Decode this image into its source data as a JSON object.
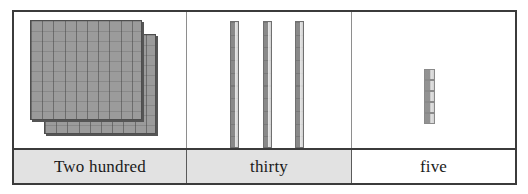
{
  "figure": {
    "kind": "place-value-blocks-table"
  },
  "colors": {
    "block_fill": "#9b9b9b",
    "block_line": "#4e4e4e",
    "table_border": "#3b3b3b",
    "label_shaded_bg": "#e2e2e2",
    "label_plain_bg": "#ffffff",
    "text": "#1a1a1a"
  },
  "columns": [
    {
      "place": "hundreds",
      "label": "Two hundred",
      "label_shaded": true,
      "block_type": "flat",
      "block_count": 2,
      "value": 200
    },
    {
      "place": "tens",
      "label": "thirty",
      "label_shaded": true,
      "block_type": "rod",
      "block_count": 3,
      "value": 30
    },
    {
      "place": "ones",
      "label": "five",
      "label_shaded": false,
      "block_type": "unit-cube",
      "block_count": 5,
      "value": 5
    }
  ]
}
